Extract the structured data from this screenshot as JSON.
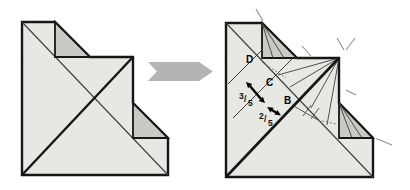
{
  "figure": {
    "kind": "origami-step-diagram",
    "colors": {
      "background": "#ffffff",
      "paper": "#e7e7e3",
      "flap": "#c9cac3",
      "outline": "#161616",
      "crease": "#3c3c3c",
      "tick": "#8f8f8f",
      "process_arrow": "#b4b4b4",
      "label": "#000000"
    },
    "process_arrow": {
      "icon": "right-arrow"
    },
    "right_step": {
      "labels": {
        "D": "D",
        "C": "C",
        "B": "B"
      },
      "fractions": {
        "large": {
          "numerator": "3",
          "separator": "/",
          "denominator": "5"
        },
        "small": {
          "numerator": "2",
          "separator": "/",
          "denominator": "5"
        }
      }
    }
  }
}
